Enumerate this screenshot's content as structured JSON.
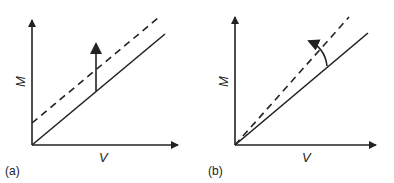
{
  "panels": [
    {
      "id": "a",
      "label": "(a)",
      "xlabel": "V",
      "ylabel": "M",
      "description": "Parallel upward shift of M-V line"
    },
    {
      "id": "b",
      "label": "(b)",
      "xlabel": "V",
      "ylabel": "M",
      "description": "Rotation of M-V line about origin"
    }
  ],
  "colors": {
    "ink": "#222222",
    "background": "#ffffff"
  }
}
